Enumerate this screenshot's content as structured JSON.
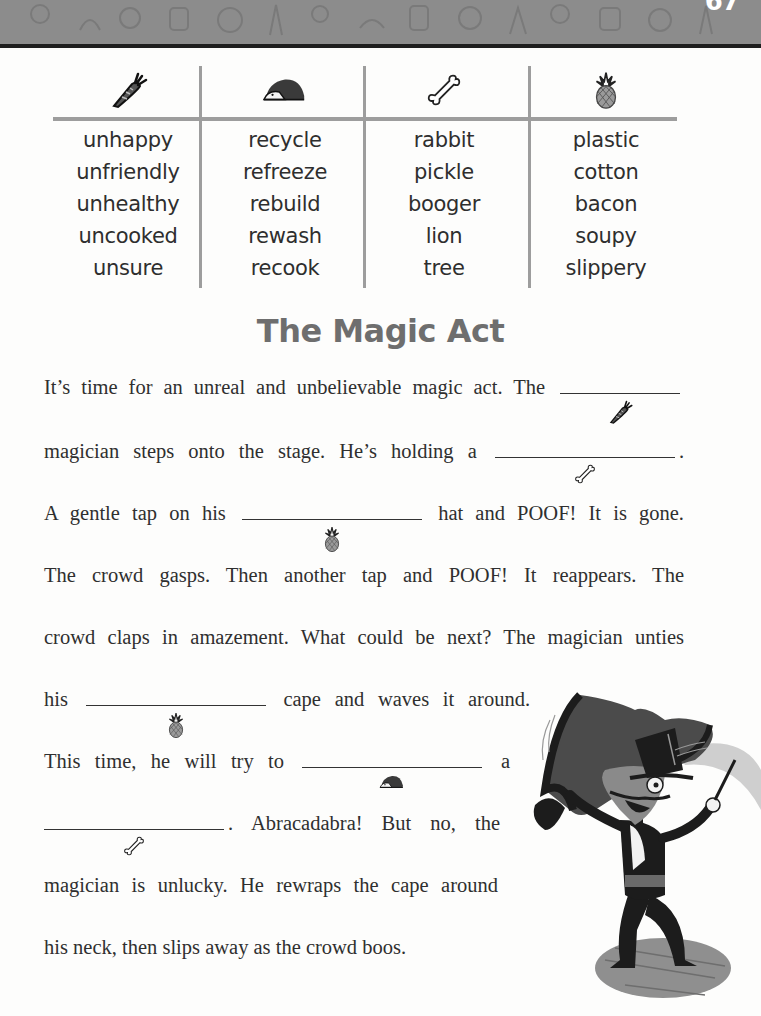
{
  "page": {
    "number": "67",
    "header_pattern": "doodle-icons-band"
  },
  "word_table": {
    "columns": [
      {
        "icon": "carrot-icon",
        "words": [
          "unhappy",
          "unfriendly",
          "unhealthy",
          "uncooked",
          "unsure"
        ]
      },
      {
        "icon": "hedgehog-icon",
        "words": [
          "recycle",
          "refreeze",
          "rebuild",
          "rewash",
          "recook"
        ]
      },
      {
        "icon": "bone-icon",
        "words": [
          "rabbit",
          "pickle",
          "booger",
          "lion",
          "tree"
        ]
      },
      {
        "icon": "pineapple-icon",
        "words": [
          "plastic",
          "cotton",
          "bacon",
          "soupy",
          "slippery"
        ]
      }
    ]
  },
  "story": {
    "title": "The Magic Act",
    "lines": [
      {
        "before": "It’s time for an unreal and unbelievable magic act. The",
        "blank_hint": "carrot-icon",
        "after": ""
      },
      {
        "before": "magician steps onto the stage. He’s holding a",
        "blank_hint": "bone-icon",
        "after": "."
      },
      {
        "before": "A gentle tap on his",
        "blank_hint": "pineapple-icon",
        "after": "hat and POOF! It is gone."
      },
      {
        "before": "The crowd gasps. Then another tap and POOF! It reappears. The",
        "blank_hint": null,
        "after": ""
      },
      {
        "before": "crowd claps in amazement. What could be next? The magician unties",
        "blank_hint": null,
        "after": ""
      },
      {
        "before": "his",
        "blank_hint": "pineapple-icon",
        "after": "cape and waves it around."
      },
      {
        "before": "This time, he will try to",
        "blank_hint": "hedgehog-icon",
        "after": "a"
      },
      {
        "before": "",
        "blank_hint": "bone-icon",
        "after": ". Abracadabra! But no, the"
      },
      {
        "before": "magician is unlucky. He rewraps the cape around",
        "blank_hint": null,
        "after": ""
      },
      {
        "before": "his neck, then slips away as the crowd boos.",
        "blank_hint": null,
        "after": ""
      }
    ]
  },
  "illustration": {
    "name": "magician-with-cape"
  },
  "colors": {
    "header_band": "#8c8c8c",
    "table_lines": "#9d9d9d",
    "title": "#6e6e6e",
    "text": "#2f2f2f"
  }
}
